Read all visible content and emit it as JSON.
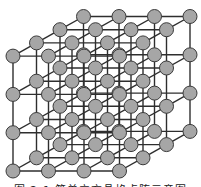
{
  "figure": {
    "type": "cubic-lattice-diagram",
    "dimensions": {
      "nx": 4,
      "ny": 4,
      "nz": 4
    },
    "origin_front_bottom_left": [
      13,
      171
    ],
    "step_x": [
      35.5,
      0
    ],
    "step_y": [
      0,
      -38.3
    ],
    "step_depth": [
      23.5,
      -13.2
    ],
    "node_radius": 7,
    "colors": {
      "node_fill": "#a6a6a6",
      "node_stroke": "#3a3a3a",
      "edge": "#2e2e2e",
      "background": "#ffffff"
    }
  },
  "caption": {
    "text": "图 2-1   简单立方晶格点阵示意图",
    "note": "caption partially clipped at bottom of image"
  }
}
